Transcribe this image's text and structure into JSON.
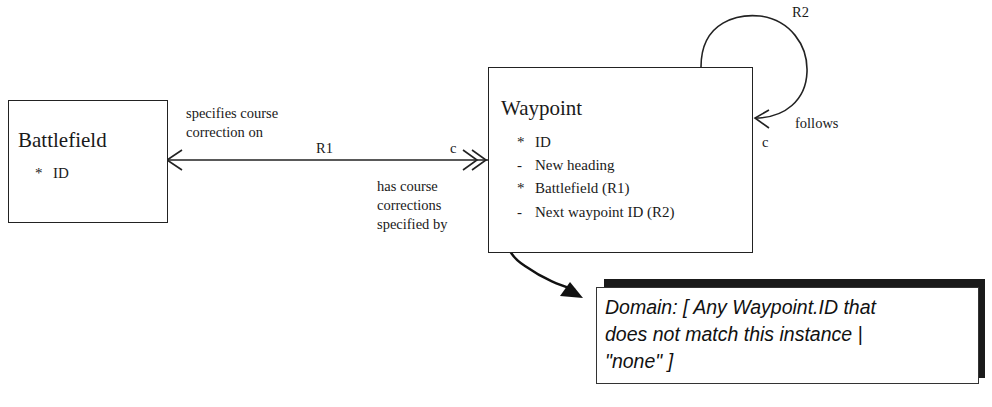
{
  "classes": [
    {
      "name": "Battlefield",
      "attributes": [
        {
          "marker": "*",
          "label": "ID"
        }
      ]
    },
    {
      "name": "Waypoint",
      "attributes": [
        {
          "marker": "*",
          "label": "ID"
        },
        {
          "marker": "-",
          "label": "New heading"
        },
        {
          "marker": "*",
          "label": "Battlefield (R1)"
        },
        {
          "marker": "-",
          "label": "Next waypoint ID (R2)"
        }
      ]
    }
  ],
  "relationships": {
    "r1": {
      "id": "R1",
      "forward_phrase": [
        "specifies course",
        "correction on"
      ],
      "reverse_phrase": [
        "has course",
        "corrections",
        "specified by"
      ],
      "conditionality": "c"
    },
    "r2": {
      "id": "R2",
      "phrase": "follows",
      "conditionality": "c"
    }
  },
  "note": {
    "lines": [
      "Domain: [ Any Waypoint.ID that",
      "does not match this instance |",
      "\"none\" ]"
    ]
  },
  "colors": {
    "line": "#222222",
    "shadow": "#1a1a1a",
    "background": "#ffffff"
  }
}
